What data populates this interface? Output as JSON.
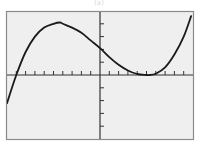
{
  "label": "(a)",
  "colors": {
    "background": "#ffffff",
    "panel": "#efefef",
    "frame": "#8a8a8a",
    "axis": "#333333",
    "curve": "#1a1a1a"
  },
  "chart_data": {
    "type": "line",
    "title": "",
    "xlabel": "",
    "ylabel": "",
    "grid": false,
    "legend": null,
    "xlim": [
      -10,
      10
    ],
    "ylim": [
      -5,
      5
    ],
    "x_ticks": [
      -9,
      -8,
      -7,
      -6,
      -5,
      -4,
      -3,
      -2,
      -1,
      1,
      2,
      3,
      4,
      5,
      6,
      7,
      8,
      9
    ],
    "y_ticks": [
      -4,
      -3,
      -2,
      -1,
      1,
      2,
      3,
      4
    ],
    "tick_labels": false,
    "annotations": [],
    "series": [
      {
        "name": "cubic",
        "description": "Cubic with a simple root near x=-9 and a double root (tangent) near x=5.3; local max near (-4.3, 4); crosses y-axis near y=2.1",
        "x": [
          -10,
          -9,
          -8,
          -7,
          -6,
          -5,
          -4.3,
          -4,
          -3,
          -2,
          -1,
          0,
          1,
          2,
          3,
          4,
          5,
          5.3,
          6,
          7,
          8,
          9,
          9.8
        ],
        "y": [
          -2.2,
          0,
          1.8,
          3.0,
          3.7,
          4.0,
          4.1,
          4.0,
          3.7,
          3.3,
          2.7,
          2.1,
          1.4,
          0.8,
          0.35,
          0.08,
          0.0,
          0.0,
          0.1,
          0.6,
          1.6,
          3.0,
          4.6
        ]
      }
    ]
  }
}
